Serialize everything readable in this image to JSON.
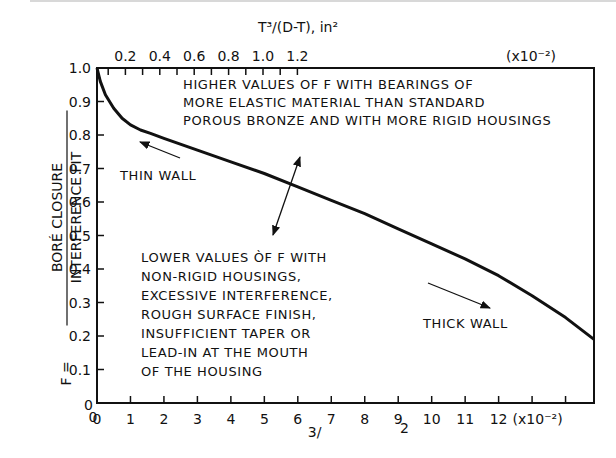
{
  "chart_data": {
    "type": "line",
    "title": "",
    "xlabel": "T³/(D-T), in² (x10⁻²)",
    "xlabel_bottom_visible": "3/   2",
    "x_multiplier_label": "(x10⁻²)",
    "ylabel_prefix": "F =",
    "ylabel_numerator": "BORÉ CLOSURE",
    "ylabel_denominator": "INTERFERENCE FIT",
    "xlim": [
      0,
      14.85
    ],
    "ylim": [
      0,
      1.0
    ],
    "grid": false,
    "x_ticks": [
      0,
      1,
      2,
      3,
      4,
      5,
      6,
      7,
      8,
      9,
      10,
      11,
      12,
      13,
      14
    ],
    "x_tick_labels": [
      "0",
      "1",
      "2",
      "3",
      "4",
      "5",
      "6",
      "7",
      "8",
      "9",
      "10",
      "11",
      "12",
      "",
      ""
    ],
    "y_ticks": [
      0,
      0.1,
      0.2,
      0.3,
      0.4,
      0.5,
      0.6,
      0.7,
      0.8,
      0.9,
      1.0
    ],
    "y_tick_labels": [
      "0",
      "0.1",
      "0.2",
      "0.3",
      "0.4",
      "0.5",
      "0.6",
      "0.7",
      "0.8",
      "0.9",
      "1.0"
    ],
    "top_axis": {
      "label": "T³/(D-T), in²",
      "multiplier_label": "(x10⁻²)",
      "ticks": [
        0.1,
        0.2,
        0.3,
        0.4,
        0.5,
        0.6,
        0.7,
        0.8,
        0.9,
        1.0,
        1.1,
        1.2
      ],
      "tick_labels": [
        "",
        "0.2",
        "",
        "0.4",
        "",
        "0.6",
        "",
        "0.8",
        "",
        "1.0",
        "",
        "1.2"
      ]
    },
    "series": [
      {
        "name": "F",
        "x": [
          0,
          0.1,
          0.25,
          0.5,
          0.75,
          1.0,
          1.3,
          1.6,
          2.0,
          3.0,
          4.0,
          5.0,
          6.0,
          7.0,
          8.0,
          9.0,
          10.0,
          11.0,
          12.0,
          13.0,
          14.0,
          14.85
        ],
        "y": [
          1.0,
          0.96,
          0.92,
          0.88,
          0.85,
          0.83,
          0.815,
          0.805,
          0.79,
          0.755,
          0.72,
          0.685,
          0.645,
          0.605,
          0.565,
          0.52,
          0.475,
          0.43,
          0.38,
          0.32,
          0.255,
          0.19
        ]
      }
    ],
    "annotations": [
      {
        "name": "higher-values-note",
        "lines": [
          "HIGHER VALUES OF F WITH BEARINGS OF",
          "MORE ELASTIC MATERIAL THAN STANDARD",
          "POROUS BRONZE AND WITH MORE RIGID HOUSINGS"
        ]
      },
      {
        "name": "lower-values-note",
        "lines": [
          "LOWER VALUES ÒF F WITH",
          "NON-RIGID HOUSINGS,",
          "EXCESSIVE INTERFERENCE,",
          "ROUGH SURFACE FINISH,",
          "INSUFFICIENT TAPER OR",
          "LEAD-IN AT THE MOUTH",
          "OF THE HOUSING"
        ]
      },
      {
        "name": "thin-wall-label",
        "text": "THIN WALL"
      },
      {
        "name": "thick-wall-label",
        "text": "THICK WALL"
      }
    ]
  }
}
